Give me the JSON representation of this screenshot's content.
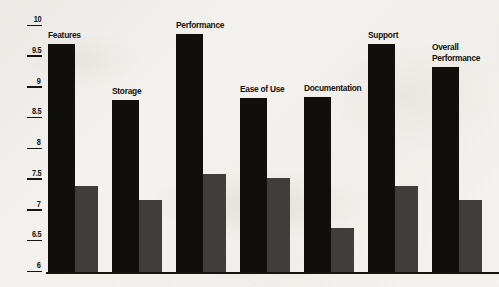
{
  "chart_data": {
    "type": "bar",
    "title": "",
    "subtitle": "",
    "xlabel": "",
    "ylabel": "",
    "ylim": [
      6,
      10
    ],
    "ytick_step": 0.5,
    "ytick_labels": [
      "10",
      "9.5",
      "9",
      "8.5",
      "8",
      "7.5",
      "7",
      "6.5",
      "6"
    ],
    "ytick_values": [
      10,
      9.5,
      9,
      8.5,
      8,
      7.5,
      7,
      6.5,
      6
    ],
    "grid": false,
    "legend": "none",
    "categories": [
      "Features",
      "Storage",
      "Performance",
      "Ease of Use",
      "Documentation",
      "Support",
      "Overall\nPerformance"
    ],
    "series": [
      {
        "name": "primary",
        "color": "#110f0b",
        "values": [
          9.7,
          8.8,
          9.87,
          8.83,
          8.85,
          9.7,
          9.33
        ]
      },
      {
        "name": "secondary",
        "color": "#3f3e3a",
        "values": [
          7.4,
          7.17,
          7.6,
          7.53,
          6.72,
          7.4,
          7.17
        ]
      }
    ]
  },
  "axis": {
    "tick_color": "#15140e",
    "baseline_color": "#15140e"
  },
  "labels": {
    "features": "Features",
    "storage": "Storage",
    "performance": "Performance",
    "ease_of_use": "Ease of Use",
    "documentation": "Documentation",
    "support": "Support",
    "overall_performance_line1": "Overall",
    "overall_performance_line2": "Performance"
  }
}
